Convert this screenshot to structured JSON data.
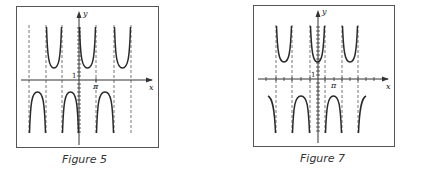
{
  "figures": [
    {
      "caption": "Figure 5",
      "x_label": "x",
      "y_label": "y",
      "x_tick_label": "π",
      "y_tick_label": "1"
    },
    {
      "caption": "Figure 7",
      "x_label": "x",
      "y_label": "y",
      "x_tick_label": "π",
      "y_tick_label": "1"
    }
  ],
  "colors": {
    "curve": "#2a2a2a",
    "frame": "#555555",
    "asymptote": "#666666"
  }
}
